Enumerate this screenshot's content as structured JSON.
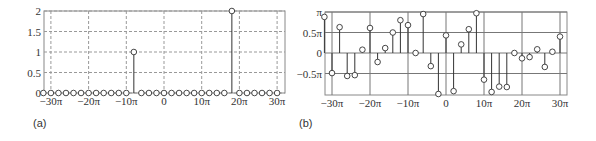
{
  "panels": {
    "a_label": "(a)",
    "b_label": "(b)"
  },
  "chart_data": [
    {
      "type": "stem",
      "panel": "(a)",
      "title": "",
      "xlabel": "",
      "ylabel": "",
      "x_unit": "π",
      "xticks": [
        "−30π",
        "−20π",
        "−10π",
        "0",
        "10π",
        "20π",
        "30π"
      ],
      "xtick_values": [
        -30,
        -20,
        -10,
        0,
        10,
        20,
        30
      ],
      "yticks": [
        "0",
        "0.5",
        "1",
        "1.5",
        "2"
      ],
      "ytick_values": [
        0,
        0.5,
        1,
        1.5,
        2
      ],
      "ylim": [
        0,
        2
      ],
      "xlim": [
        -32,
        30
      ],
      "grid": "dashed",
      "x": [
        -32,
        -30,
        -28,
        -26,
        -24,
        -22,
        -20,
        -18,
        -16,
        -14,
        -12,
        -10,
        -8,
        -6,
        -4,
        -2,
        0,
        2,
        4,
        6,
        8,
        10,
        12,
        14,
        16,
        18,
        20,
        22,
        24,
        26,
        28,
        30
      ],
      "values": [
        0,
        0,
        0,
        0,
        0,
        0,
        0,
        0,
        0,
        0,
        0,
        0,
        1,
        0,
        0,
        0,
        0,
        0,
        0,
        0,
        0,
        0,
        0,
        0,
        0,
        2,
        0,
        0,
        0,
        0,
        0,
        0
      ]
    },
    {
      "type": "stem",
      "panel": "(b)",
      "title": "",
      "xlabel": "",
      "ylabel": "",
      "x_unit": "π",
      "y_unit": "π",
      "xticks": [
        "−30π",
        "−20π",
        "−10π",
        "0",
        "10π",
        "20π",
        "30π"
      ],
      "xtick_values": [
        -30,
        -20,
        -10,
        0,
        10,
        20,
        30
      ],
      "yticks": [
        "π",
        "0.5π",
        "0",
        "−0.5π"
      ],
      "ytick_values": [
        1,
        0.5,
        0,
        -0.5
      ],
      "ylim": [
        -1,
        1
      ],
      "xlim": [
        -32,
        30
      ],
      "grid": "solid",
      "x": [
        -32,
        -30,
        -28,
        -26,
        -24,
        -22,
        -20,
        -18,
        -16,
        -14,
        -12,
        -10,
        -8,
        -6,
        -4,
        -2,
        0,
        2,
        4,
        6,
        8,
        10,
        12,
        14,
        16,
        18,
        20,
        22,
        24,
        26,
        28,
        30
      ],
      "values": [
        0.88,
        -0.49,
        0.63,
        -0.56,
        -0.54,
        0.08,
        0.61,
        -0.22,
        0.12,
        0.5,
        0.8,
        0.68,
        0,
        0.95,
        -0.32,
        -1.0,
        0.43,
        -0.93,
        0.21,
        0.58,
        0.97,
        -0.65,
        -0.95,
        -0.82,
        -0.83,
        0,
        -0.13,
        -0.1,
        0.09,
        -0.34,
        0.03,
        0.4
      ]
    }
  ]
}
